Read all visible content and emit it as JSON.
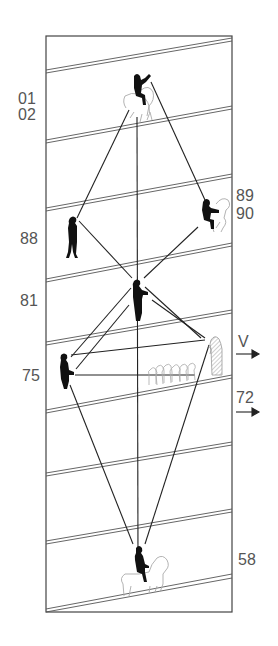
{
  "diagram": {
    "colors": {
      "ink": "#1a1a1a",
      "outline": "#999999",
      "label": "#555555",
      "background": "#ffffff"
    },
    "frame": {
      "x": 46,
      "y": 36,
      "width": 186,
      "height": 576
    },
    "labels": {
      "left": [
        {
          "id": "l01",
          "text": "01",
          "x": 18,
          "y": 90
        },
        {
          "id": "l02",
          "text": "02",
          "x": 18,
          "y": 106
        },
        {
          "id": "l88",
          "text": "88",
          "x": 20,
          "y": 230
        },
        {
          "id": "l81",
          "text": "81",
          "x": 20,
          "y": 292
        },
        {
          "id": "l75",
          "text": "75",
          "x": 22,
          "y": 367
        }
      ],
      "right": [
        {
          "id": "r89",
          "text": "89",
          "x": 236,
          "y": 187
        },
        {
          "id": "r90",
          "text": "90",
          "x": 236,
          "y": 205
        },
        {
          "id": "rV",
          "text": "V",
          "x": 238,
          "y": 333
        },
        {
          "id": "r72",
          "text": "72",
          "x": 236,
          "y": 389
        },
        {
          "id": "r58",
          "text": "58",
          "x": 238,
          "y": 551
        }
      ]
    },
    "arrows": [
      {
        "id": "arrow-v",
        "x1": 236,
        "y1": 354,
        "x2": 258,
        "y2": 354
      },
      {
        "id": "arrow-72",
        "x1": 236,
        "y1": 412,
        "x2": 258,
        "y2": 412
      }
    ],
    "figures": [
      {
        "id": "rider-top",
        "type": "horseman",
        "x": 137,
        "y": 95
      },
      {
        "id": "rider-right",
        "type": "horseman-small",
        "x": 210,
        "y": 215
      },
      {
        "id": "standing-left",
        "type": "standing-person",
        "x": 72,
        "y": 240
      },
      {
        "id": "standing-center",
        "type": "standing-person-holding",
        "x": 138,
        "y": 300
      },
      {
        "id": "standing-lower-left",
        "type": "standing-person-holding",
        "x": 63,
        "y": 372
      },
      {
        "id": "statue-right",
        "type": "hatched-statue",
        "x": 212,
        "y": 358
      },
      {
        "id": "crowd",
        "type": "outline-crowd",
        "x": 168,
        "y": 373
      },
      {
        "id": "rider-bottom",
        "type": "horseman",
        "x": 140,
        "y": 570
      }
    ],
    "bands_left_y": [
      70,
      140,
      208,
      282,
      342,
      411,
      473,
      541,
      610
    ],
    "band_slope_px": 32
  }
}
